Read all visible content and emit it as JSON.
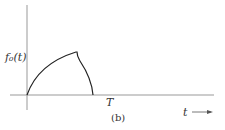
{
  "figure": {
    "caption": "(b)",
    "y_label": "f₀(t)",
    "x_label": "t",
    "x_tick_label": "T",
    "arrow": "→",
    "curve_description": "Pulse starting at origin, rising concavely to a peak with a cusp, then falling to zero before T"
  },
  "colors": {
    "axis": "#888888",
    "curve": "#222222",
    "text": "#333333"
  }
}
